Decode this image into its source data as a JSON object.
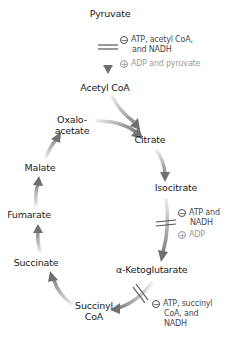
{
  "diagram": {
    "nodes": {
      "pyruvate": "Pyruvate",
      "acetyl_coa": "Acetyl CoA",
      "oxaloacetate_1": "Oxalo-",
      "oxaloacetate_2": "acetate",
      "citrate": "Citrate",
      "isocitrate": "Isocitrate",
      "alpha_ketoglutarate": "α-Ketoglutarate",
      "succinyl_coa_1": "Succinyl",
      "succinyl_coa_2": "CoA",
      "succinate": "Succinate",
      "fumarate": "Fumarate",
      "malate": "Malate"
    },
    "regulation": {
      "pdh": {
        "inhibitor_symbol": "−",
        "inhibitor_1": "ATP, acetyl CoA,",
        "inhibitor_2": "and NADH",
        "activator_symbol": "+",
        "activator": "ADP and pyruvate"
      },
      "idh": {
        "inhibitor_symbol": "−",
        "inhibitor_1": "ATP and",
        "inhibitor_2": "NADH",
        "activator_symbol": "+",
        "activator": "ADP"
      },
      "akgdh": {
        "inhibitor_symbol": "−",
        "inhibitor_1": "ATP, succinyl",
        "inhibitor_2": "CoA, and",
        "inhibitor_3": "NADH"
      }
    },
    "colors": {
      "arrow": "#7a7a7a",
      "arrow_light": "#e6e6e6",
      "inhibitor_text": "#4a4a4a",
      "activator_text": "#9a9a9a"
    }
  }
}
